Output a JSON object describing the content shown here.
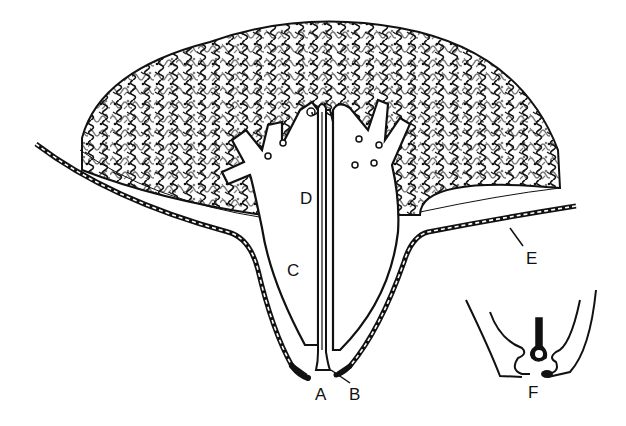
{
  "diagram": {
    "type": "anatomical-line-drawing",
    "colors": {
      "ink": "#111111",
      "background": "#ffffff"
    },
    "labels": {
      "A": {
        "text": "A",
        "x": 315,
        "y": 386
      },
      "B": {
        "text": "B",
        "x": 349,
        "y": 386
      },
      "C": {
        "text": "C",
        "x": 287,
        "y": 262
      },
      "D": {
        "text": "D",
        "x": 300,
        "y": 190
      },
      "E": {
        "text": "E",
        "x": 526,
        "y": 250
      },
      "F": {
        "text": "F",
        "x": 528,
        "y": 384
      }
    },
    "parts": [
      {
        "id": "glandular-tissue",
        "description": "lobular glandular tissue mass (top)"
      },
      {
        "id": "teat-skin",
        "description": "outer skin with dashed layer, labeled E"
      },
      {
        "id": "teat-cistern",
        "description": "cistern cavity, labeled C"
      },
      {
        "id": "gland-cistern",
        "description": "upper cistern region, labeled D"
      },
      {
        "id": "streak-canal",
        "description": "central canal, labeled A"
      },
      {
        "id": "sphincter",
        "description": "pointer to teat end tissue, labeled B"
      },
      {
        "id": "inset-detail",
        "description": "inset detail of teat end, labeled F"
      }
    ]
  }
}
